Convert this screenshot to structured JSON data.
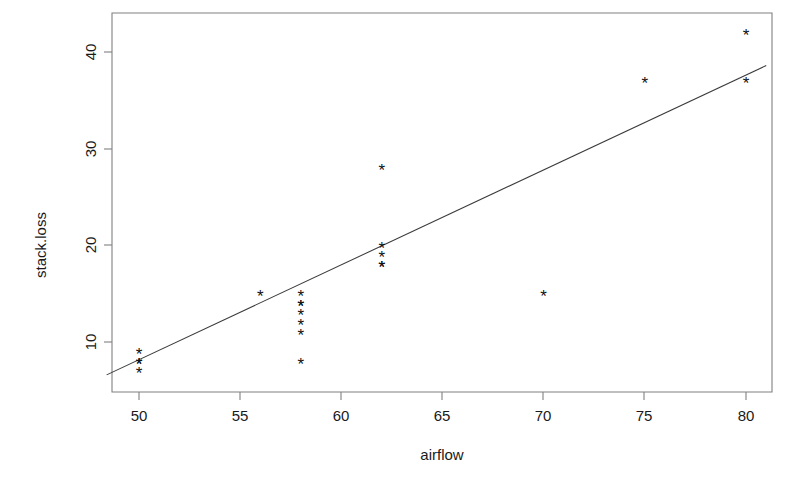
{
  "chart_data": {
    "type": "scatter",
    "title": "",
    "subtitle": "",
    "xlabel": "airflow",
    "ylabel": "stack.loss",
    "xlim": [
      48.4,
      81.0
    ],
    "ylim": [
      5.7,
      43.3
    ],
    "xticks": [
      50,
      55,
      60,
      65,
      70,
      75,
      80
    ],
    "yticks": [
      10,
      20,
      30,
      40
    ],
    "xtick_labels": [
      "50",
      "55",
      "60",
      "65",
      "70",
      "75",
      "80"
    ],
    "ytick_labels": [
      "10",
      "20",
      "30",
      "40"
    ],
    "grid": false,
    "legend": false,
    "legend_position": "none",
    "marker": "asterisk",
    "marker_glyph": "*",
    "marker_color": "#111111",
    "series": [
      {
        "name": "stack.loss vs airflow",
        "points": [
          {
            "x": 80,
            "y": 42
          },
          {
            "x": 80,
            "y": 37
          },
          {
            "x": 75,
            "y": 37
          },
          {
            "x": 62,
            "y": 28
          },
          {
            "x": 62,
            "y": 18
          },
          {
            "x": 62,
            "y": 18
          },
          {
            "x": 62,
            "y": 19
          },
          {
            "x": 62,
            "y": 20
          },
          {
            "x": 58,
            "y": 15
          },
          {
            "x": 58,
            "y": 14
          },
          {
            "x": 58,
            "y": 14
          },
          {
            "x": 58,
            "y": 13
          },
          {
            "x": 58,
            "y": 11
          },
          {
            "x": 58,
            "y": 12
          },
          {
            "x": 58,
            "y": 8
          },
          {
            "x": 50,
            "y": 7
          },
          {
            "x": 50,
            "y": 8
          },
          {
            "x": 50,
            "y": 8
          },
          {
            "x": 50,
            "y": 9
          },
          {
            "x": 56,
            "y": 15
          },
          {
            "x": 70,
            "y": 15
          }
        ]
      }
    ],
    "fit_line": {
      "name": "least-squares regression line",
      "x_start": 48.4,
      "y_start": 6.6,
      "x_end": 81.0,
      "y_end": 38.6
    }
  },
  "axes": {
    "x_title": "airflow",
    "y_title": "stack.loss"
  }
}
